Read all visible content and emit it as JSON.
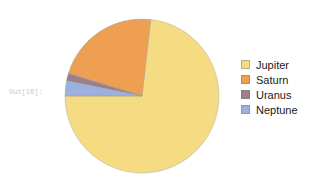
{
  "notebook": {
    "output_prompt": "Out[16]:"
  },
  "chart_data": {
    "type": "pie",
    "title": "",
    "categories": [
      "Jupiter",
      "Saturn",
      "Uranus",
      "Neptune"
    ],
    "values": [
      71.0,
      21.4,
      1.5,
      3.1
    ],
    "units": "percent",
    "start_angle": 180,
    "direction": "counterclockwise",
    "colors": [
      "#F5DC82",
      "#EE9F52",
      "#9B7F8C",
      "#9BB0DC"
    ],
    "legend_position": "right",
    "grid": false,
    "labels_shown": false,
    "series": [
      {
        "name": "Planet mass share",
        "values": [
          71.0,
          21.4,
          1.5,
          3.1
        ]
      }
    ],
    "slices": [
      {
        "label": "Jupiter",
        "value": 71.0,
        "color": "#F5DC82"
      },
      {
        "label": "Saturn",
        "value": 21.4,
        "color": "#EE9F52"
      },
      {
        "label": "Uranus",
        "value": 1.5,
        "color": "#9B7F8C"
      },
      {
        "label": "Neptune",
        "value": 3.1,
        "color": "#9BB0DC"
      }
    ]
  },
  "legend": {
    "items": [
      {
        "label": "Jupiter",
        "color": "#F5DC82"
      },
      {
        "label": "Saturn",
        "color": "#EE9F52"
      },
      {
        "label": "Uranus",
        "color": "#9B7F8C"
      },
      {
        "label": "Neptune",
        "color": "#9BB0DC"
      }
    ]
  }
}
